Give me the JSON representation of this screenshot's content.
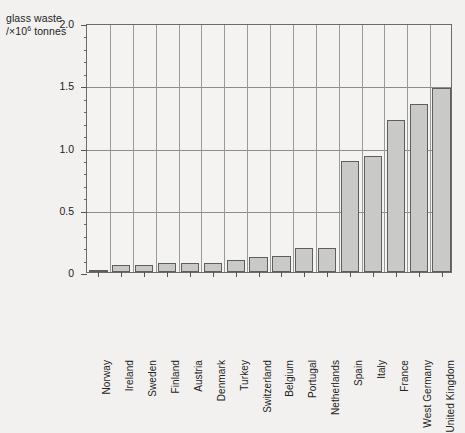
{
  "chart_data": {
    "type": "bar",
    "title": "",
    "ylabel": "glass waste /×10⁶ tonnes",
    "ylabel_line1": "glass waste",
    "ylabel_line2_prefix": "/×10",
    "ylabel_line2_sup": "6",
    "ylabel_line2_suffix": " tonnes",
    "xlabel": "",
    "ylim": [
      0,
      2.0
    ],
    "ytick_labels": [
      "0",
      "0.5",
      "1.0",
      "1.5",
      "2.0"
    ],
    "ytick_values": [
      0,
      0.5,
      1.0,
      1.5,
      2.0
    ],
    "yminor_step": 0.1,
    "grid": "horizontal-and-vertical",
    "legend": "none",
    "categories": [
      "Norway",
      "Ireland",
      "Sweden",
      "Finland",
      "Austria",
      "Denmark",
      "Turkey",
      "Switzerland",
      "Belgium",
      "Portugal",
      "Netherlands",
      "Spain",
      "Italy",
      "France",
      "West Germany",
      "United Kingdom"
    ],
    "values": [
      0.02,
      0.06,
      0.06,
      0.07,
      0.07,
      0.07,
      0.1,
      0.12,
      0.13,
      0.19,
      0.19,
      0.89,
      0.93,
      1.22,
      1.35,
      1.48
    ],
    "bar_fill_color": "#c9c9c7",
    "bar_edge_color": "#5e5e5e",
    "plot_background": "#f4f3f1",
    "page_background": "#f2f1ef",
    "grid_color": "#8d8d8d",
    "axis_color": "#6b6b6b"
  }
}
